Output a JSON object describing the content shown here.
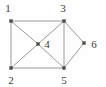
{
  "figure": {
    "background_color": "#fefefe",
    "edge_color": "#9a9a9a",
    "node_color": "#4d4d4d",
    "label_color": "#3a3a3a",
    "width": 106,
    "height": 87
  },
  "chart_data": {
    "type": "diagram",
    "subtype": "node-link-graph",
    "directed": false,
    "nodes": [
      {
        "id": "1",
        "label": "1",
        "x": 11,
        "y": 21,
        "label_x": 8,
        "label_y": 8
      },
      {
        "id": "2",
        "label": "2",
        "x": 11,
        "y": 68,
        "label_x": 11,
        "label_y": 80
      },
      {
        "id": "3",
        "label": "3",
        "x": 64,
        "y": 21,
        "label_x": 63,
        "label_y": 8
      },
      {
        "id": "4",
        "label": "4",
        "x": 38,
        "y": 44,
        "label_x": 47,
        "label_y": 44
      },
      {
        "id": "5",
        "label": "5",
        "x": 64,
        "y": 68,
        "label_x": 64,
        "label_y": 80
      },
      {
        "id": "6",
        "label": "6",
        "x": 84,
        "y": 43,
        "label_x": 94,
        "label_y": 44
      }
    ],
    "edges": [
      {
        "source": "1",
        "target": "3"
      },
      {
        "source": "1",
        "target": "2"
      },
      {
        "source": "2",
        "target": "5"
      },
      {
        "source": "3",
        "target": "5"
      },
      {
        "source": "1",
        "target": "4"
      },
      {
        "source": "2",
        "target": "4"
      },
      {
        "source": "3",
        "target": "4"
      },
      {
        "source": "4",
        "target": "5"
      },
      {
        "source": "3",
        "target": "6"
      },
      {
        "source": "5",
        "target": "6"
      }
    ]
  }
}
